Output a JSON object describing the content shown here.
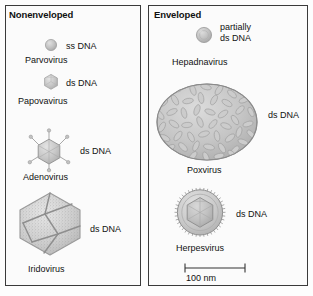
{
  "figure": {
    "panels": [
      {
        "id": "nonenveloped",
        "title": "Nonenveloped",
        "viruses": [
          {
            "name": "Parvovirus",
            "genome": "ss DNA",
            "shape": "small-sphere"
          },
          {
            "name": "Papovavirus",
            "genome": "ds DNA",
            "shape": "small-icosahedron"
          },
          {
            "name": "Adenovirus",
            "genome": "ds DNA",
            "shape": "icosahedron-with-fibers"
          },
          {
            "name": "Iridovirus",
            "genome": "ds DNA",
            "shape": "large-granular-icosahedron"
          }
        ]
      },
      {
        "id": "enveloped",
        "title": "Enveloped",
        "viruses": [
          {
            "name": "Hepadnavirus",
            "genome": "partially\nds DNA",
            "genome_line1": "partially",
            "genome_line2": "ds DNA",
            "shape": "small-enveloped-sphere"
          },
          {
            "name": "Poxvirus",
            "genome": "ds DNA",
            "shape": "brick-oval-textured"
          },
          {
            "name": "Herpesvirus",
            "genome": "ds DNA",
            "shape": "spiky-envelope-with-capsid"
          }
        ]
      }
    ],
    "scale": {
      "label": "100 nm"
    },
    "colors": {
      "outline": "#3a3a3a",
      "virus_fill": "#c9c9c9",
      "virus_stroke": "#8d8d8d",
      "text": "#111111",
      "panel_bg": "#fbfbfb"
    }
  }
}
